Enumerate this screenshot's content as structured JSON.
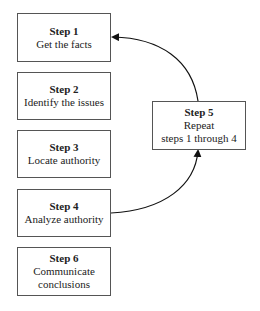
{
  "steps": [
    {
      "title": "Step 1",
      "lines": [
        "Get the facts"
      ]
    },
    {
      "title": "Step 2",
      "lines": [
        "Identify the issues"
      ]
    },
    {
      "title": "Step 3",
      "lines": [
        "Locate authority"
      ]
    },
    {
      "title": "Step 4",
      "lines": [
        "Analyze authority"
      ]
    },
    {
      "title": "Step 5",
      "lines": [
        "Repeat",
        "steps 1 through 4"
      ]
    },
    {
      "title": "Step 6",
      "lines": [
        "Communicate",
        "conclusions"
      ]
    }
  ],
  "arrows": [
    {
      "from": "Step 4",
      "to": "Step 5",
      "type": "curved-arrow"
    },
    {
      "from": "Step 5",
      "to": "Step 1",
      "type": "curved-arrow"
    }
  ]
}
